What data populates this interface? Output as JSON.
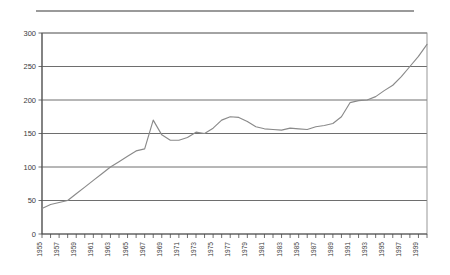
{
  "figure": {
    "name": "line-chart-figure",
    "top_rule": true,
    "background": "#ffffff"
  },
  "chart_data": {
    "type": "line",
    "title": "",
    "subtitle": "",
    "xlabel": "",
    "ylabel": "",
    "grid": true,
    "legend": "none",
    "line_color": "#8a8a8a",
    "axis_color": "#4a4a4a",
    "grid_color": "#5d5d5d",
    "xlim": [
      1955,
      2000
    ],
    "ylim": [
      0,
      300
    ],
    "yticks": [
      0,
      50,
      100,
      150,
      200,
      250,
      300
    ],
    "ytick_labels": [
      "0",
      "50",
      "100",
      "150",
      "200",
      "250",
      "300"
    ],
    "xticks": [
      1955,
      1957,
      1959,
      1961,
      1963,
      1965,
      1967,
      1969,
      1971,
      1973,
      1975,
      1977,
      1979,
      1981,
      1983,
      1985,
      1987,
      1989,
      1991,
      1993,
      1995,
      1997,
      1999
    ],
    "xtick_labels": [
      "1955",
      "1957",
      "1959",
      "1961",
      "1963",
      "1965",
      "1967",
      "1969",
      "1971",
      "1973",
      "1975",
      "1977",
      "1979",
      "1981",
      "1983",
      "1985",
      "1987",
      "1989",
      "1991",
      "1993",
      "1995",
      "1997",
      "1999"
    ],
    "xtick_label_rotation": -90,
    "minor_xticks_every": 1,
    "x": [
      1955,
      1956,
      1957,
      1958,
      1959,
      1960,
      1961,
      1962,
      1963,
      1964,
      1965,
      1966,
      1967,
      1968,
      1969,
      1970,
      1971,
      1972,
      1973,
      1974,
      1975,
      1976,
      1977,
      1978,
      1979,
      1980,
      1981,
      1982,
      1983,
      1984,
      1985,
      1986,
      1987,
      1988,
      1989,
      1990,
      1991,
      1992,
      1993,
      1994,
      1995,
      1996,
      1997,
      1998,
      1999,
      2000
    ],
    "values": [
      38,
      44,
      47,
      50,
      60,
      70,
      80,
      90,
      100,
      108,
      116,
      124,
      127,
      170,
      148,
      140,
      140,
      144,
      152,
      150,
      158,
      170,
      175,
      174,
      168,
      160,
      157,
      156,
      155,
      158,
      157,
      156,
      160,
      162,
      165,
      175,
      196,
      199,
      200,
      205,
      214,
      222,
      235,
      250,
      265,
      283
    ],
    "series": [
      {
        "name": "series-1",
        "values": [
          38,
          44,
          47,
          50,
          60,
          70,
          80,
          90,
          100,
          108,
          116,
          124,
          127,
          170,
          148,
          140,
          140,
          144,
          152,
          150,
          158,
          170,
          175,
          174,
          168,
          160,
          157,
          156,
          155,
          158,
          157,
          156,
          160,
          162,
          165,
          175,
          196,
          199,
          200,
          205,
          214,
          222,
          235,
          250,
          265,
          283
        ]
      }
    ]
  }
}
